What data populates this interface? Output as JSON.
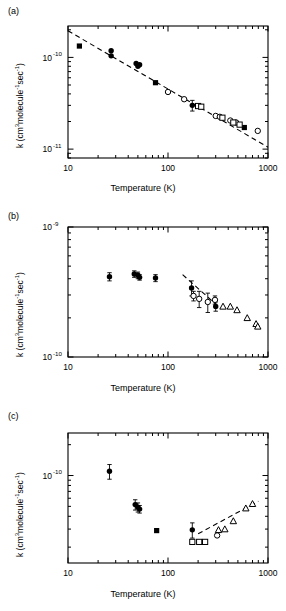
{
  "figure": {
    "panels": [
      {
        "id": "a",
        "label": "(a)"
      },
      {
        "id": "b",
        "label": "(b)"
      },
      {
        "id": "c",
        "label": "(c)"
      }
    ]
  },
  "axis_text": {
    "xlabel": "Temperature (K)",
    "ylabel_prefix": "k (cm",
    "ylabel_sup3": "3",
    "ylabel_mid": "molecule",
    "ylabel_sup_m1a": "-1",
    "ylabel_sec": "sec",
    "ylabel_sup_m1b": "-1",
    "ylabel_suffix": ")",
    "x_ticks": [
      "10",
      "100",
      "1000"
    ],
    "y_ticks_a": [
      "10",
      "10"
    ],
    "y_exp_a": [
      "-10",
      "-11"
    ],
    "y_ticks_b": [
      "10",
      "10"
    ],
    "y_exp_b": [
      "-9",
      "-10"
    ],
    "y_ticks_c": [
      "10"
    ],
    "y_exp_c": [
      "-10"
    ]
  },
  "chart_data": [
    {
      "type": "scatter",
      "panel": "a",
      "title": "",
      "xlabel": "Temperature (K)",
      "ylabel": "k (cm3 molecule-1 sec-1)",
      "xscale": "log",
      "yscale": "log",
      "xlim": [
        10,
        1000
      ],
      "ylim": [
        8e-12,
        2.2e-10
      ],
      "grid": false,
      "legend": "none",
      "fit_line": {
        "style": "dashed",
        "x": [
          10,
          1000
        ],
        "y": [
          1.95e-10,
          1.05e-11
        ],
        "description": "power-law decline across full range"
      },
      "series": [
        {
          "name": "filled-square",
          "marker": "filled-square",
          "points": [
            {
              "x": 13,
              "y": 1.33e-10
            },
            {
              "x": 75,
              "y": 5.3e-11
            },
            {
              "x": 580,
              "y": 1.72e-11
            }
          ]
        },
        {
          "name": "filled-circle",
          "marker": "filled-circle",
          "points": [
            {
              "x": 27,
              "y": 1.18e-10
            },
            {
              "x": 27,
              "y": 1.04e-10
            },
            {
              "x": 48,
              "y": 8.6e-11
            },
            {
              "x": 52,
              "y": 8.3e-11
            },
            {
              "x": 50,
              "y": 8e-11
            },
            {
              "x": 175,
              "y": 3e-11,
              "yerr": 4e-12
            }
          ]
        },
        {
          "name": "open-circle",
          "marker": "open-circle",
          "points": [
            {
              "x": 100,
              "y": 4.2e-11
            },
            {
              "x": 145,
              "y": 3.5e-11
            },
            {
              "x": 300,
              "y": 2.3e-11
            },
            {
              "x": 330,
              "y": 2.25e-11
            },
            {
              "x": 420,
              "y": 2.05e-11
            },
            {
              "x": 480,
              "y": 1.95e-11
            },
            {
              "x": 790,
              "y": 1.58e-11
            }
          ]
        },
        {
          "name": "open-square",
          "marker": "open-square",
          "points": [
            {
              "x": 200,
              "y": 2.95e-11
            },
            {
              "x": 215,
              "y": 2.9e-11
            },
            {
              "x": 350,
              "y": 2.2e-11
            },
            {
              "x": 450,
              "y": 1.95e-11
            },
            {
              "x": 520,
              "y": 1.85e-11
            }
          ]
        }
      ]
    },
    {
      "type": "scatter",
      "panel": "b",
      "title": "",
      "xlabel": "Temperature (K)",
      "ylabel": "k (cm3 molecule-1 sec-1)",
      "xscale": "log",
      "yscale": "log",
      "xlim": [
        10,
        1000
      ],
      "ylim": [
        1e-10,
        1e-09
      ],
      "grid": false,
      "legend": "none",
      "fit_line": {
        "style": "dashed",
        "x": [
          140,
          300
        ],
        "y": [
          4.3e-10,
          2.55e-10
        ],
        "description": "short dashed segment over mid-temperature data"
      },
      "series": [
        {
          "name": "filled-circle",
          "marker": "filled-circle",
          "points": [
            {
              "x": 26,
              "y": 4.15e-10,
              "yerr": 3e-11
            },
            {
              "x": 46,
              "y": 4.35e-10,
              "yerr": 2.5e-11
            },
            {
              "x": 50,
              "y": 4.25e-10,
              "yerr": 2.5e-11
            },
            {
              "x": 52,
              "y": 4.1e-10,
              "yerr": 2e-11
            },
            {
              "x": 75,
              "y": 4.05e-10,
              "yerr": 2.5e-11
            },
            {
              "x": 172,
              "y": 3.4e-10,
              "yerr": 4.5e-11
            },
            {
              "x": 300,
              "y": 2.45e-10,
              "yerr": 2e-11
            }
          ]
        },
        {
          "name": "open-circle",
          "marker": "open-circle",
          "points": [
            {
              "x": 180,
              "y": 2.95e-10,
              "yerr": 2.5e-11
            },
            {
              "x": 205,
              "y": 2.8e-10,
              "yerr": 4e-11
            },
            {
              "x": 250,
              "y": 2.65e-10,
              "yerr": 4.5e-11
            },
            {
              "x": 295,
              "y": 2.75e-10,
              "yerr": 2e-11
            }
          ]
        },
        {
          "name": "open-triangle",
          "marker": "open-triangle",
          "points": [
            {
              "x": 355,
              "y": 2.45e-10
            },
            {
              "x": 420,
              "y": 2.45e-10
            },
            {
              "x": 490,
              "y": 2.3e-10
            },
            {
              "x": 620,
              "y": 2e-10
            },
            {
              "x": 760,
              "y": 1.8e-10
            },
            {
              "x": 790,
              "y": 1.72e-10
            }
          ]
        }
      ]
    },
    {
      "type": "scatter",
      "panel": "c",
      "title": "",
      "xlabel": "Temperature (K)",
      "ylabel": "k (cm3 molecule-1 sec-1)",
      "xscale": "log",
      "yscale": "log",
      "xlim": [
        10,
        1000
      ],
      "ylim": [
        1.4e-11,
        2.6e-10
      ],
      "grid": false,
      "legend": "none",
      "fit_line": {
        "style": "dashed",
        "x": [
          200,
          800
        ],
        "y": [
          2.7e-11,
          5.6e-11
        ],
        "description": "dashed curve rising through high-temperature data"
      },
      "series": [
        {
          "name": "filled-circle",
          "marker": "filled-circle",
          "points": [
            {
              "x": 26,
              "y": 1.1e-10,
              "yerr": 1.8e-11
            },
            {
              "x": 47,
              "y": 5.2e-11,
              "yerr": 6e-12
            },
            {
              "x": 50,
              "y": 4.9e-11,
              "yerr": 5e-12
            },
            {
              "x": 52,
              "y": 4.7e-11,
              "yerr": 4e-12
            },
            {
              "x": 175,
              "y": 2.95e-11,
              "yerr": 5e-12
            }
          ]
        },
        {
          "name": "filled-square",
          "marker": "filled-square",
          "points": [
            {
              "x": 77,
              "y": 2.9e-11
            }
          ]
        },
        {
          "name": "open-square",
          "marker": "open-square",
          "points": [
            {
              "x": 175,
              "y": 2.25e-11
            },
            {
              "x": 205,
              "y": 2.25e-11
            },
            {
              "x": 235,
              "y": 2.25e-11
            }
          ]
        },
        {
          "name": "open-circle",
          "marker": "open-circle",
          "points": [
            {
              "x": 310,
              "y": 2.6e-11
            }
          ]
        },
        {
          "name": "open-triangle",
          "marker": "open-triangle",
          "points": [
            {
              "x": 320,
              "y": 2.95e-11
            },
            {
              "x": 370,
              "y": 3e-11
            },
            {
              "x": 450,
              "y": 3.6e-11
            },
            {
              "x": 600,
              "y": 4.8e-11
            },
            {
              "x": 700,
              "y": 5.3e-11
            }
          ]
        }
      ]
    }
  ]
}
